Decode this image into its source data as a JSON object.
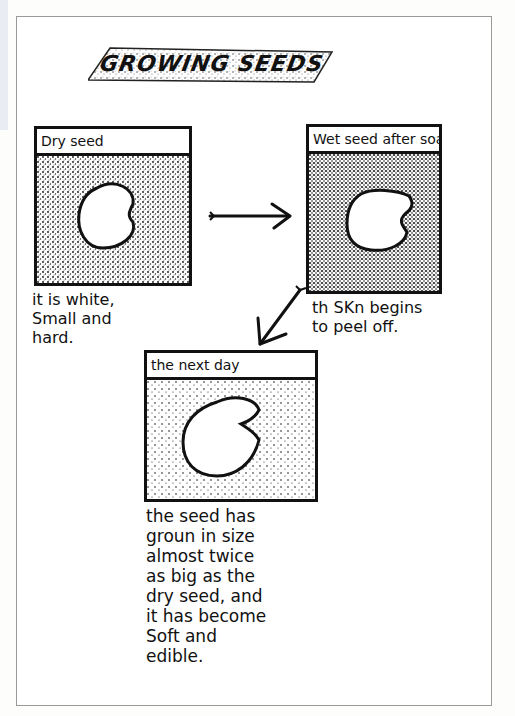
{
  "page": {
    "title": "GROWING SEEDS",
    "frame_color": "#9a9a9a",
    "ink_color": "#111111"
  },
  "panels": [
    {
      "label": "Dry seed",
      "caption": "it is white,\nSmall and\nhard.",
      "seed_shape": "bean"
    },
    {
      "label": "Wet seed after soakin",
      "caption": "th SKn begins\nto peel off.",
      "seed_shape": "notched"
    },
    {
      "label": "the next day",
      "caption": "the seed has\ngroun in size\nalmost twice\nas big as the\ndry seed, and\nit has become\nSoft and\nedible.",
      "seed_shape": "notched-large"
    }
  ],
  "arrows": [
    {
      "name": "right-arrow-icon",
      "from": "panel-1",
      "to": "panel-2"
    },
    {
      "name": "down-left-arrow-icon",
      "from": "panel-2",
      "to": "panel-3"
    }
  ]
}
